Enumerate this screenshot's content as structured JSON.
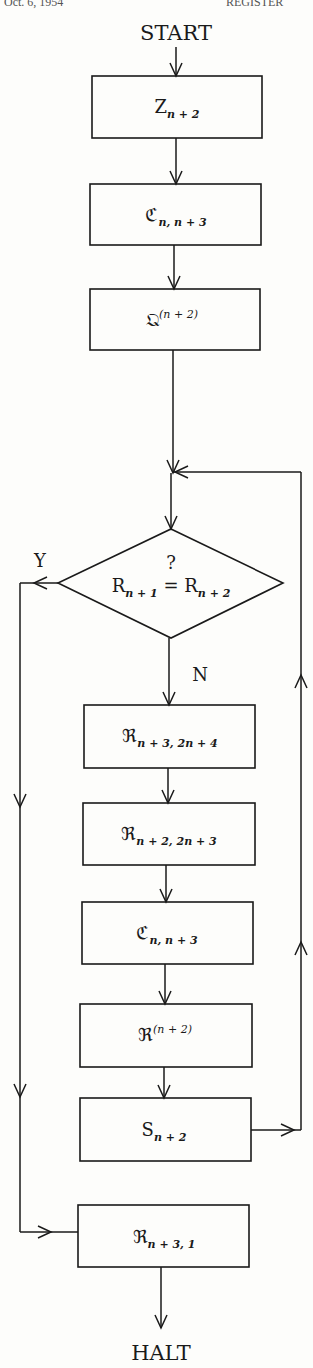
{
  "header": {
    "left_fragment": "Oct. 6, 1954",
    "right_fragment": "REGISTER"
  },
  "flow": {
    "start": "START",
    "halt": "HALT",
    "yes": "Y",
    "no": "N",
    "question_mark": "?"
  },
  "nodes": [
    {
      "id": "z",
      "base": "Z",
      "sub": "n + 2",
      "sup": ""
    },
    {
      "id": "c1",
      "base": "ℭ",
      "sub": "n, n + 3",
      "sup": ""
    },
    {
      "id": "q",
      "base": "𝔔",
      "sub": "",
      "sup": "(n + 2)"
    },
    {
      "id": "decision",
      "left_base": "R",
      "left_sub": "n + 1",
      "op": "=",
      "right_base": "R",
      "right_sub": "n + 2"
    },
    {
      "id": "r1",
      "base": "ℜ",
      "sub": "n + 3, 2n + 4",
      "sup": ""
    },
    {
      "id": "r2",
      "base": "ℜ",
      "sub": "n + 2, 2n + 3",
      "sup": ""
    },
    {
      "id": "c2",
      "base": "ℭ",
      "sub": "n, n + 3",
      "sup": ""
    },
    {
      "id": "r3",
      "base": "ℜ",
      "sub": "",
      "sup": "(n + 2)"
    },
    {
      "id": "s",
      "base": "S",
      "sub": "n + 2",
      "sup": ""
    },
    {
      "id": "r4",
      "base": "ℜ",
      "sub": "n + 3, 1",
      "sup": ""
    }
  ]
}
